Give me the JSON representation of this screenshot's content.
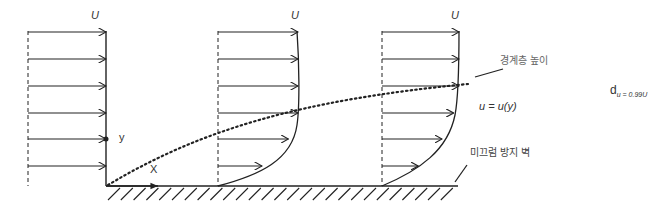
{
  "diagram": {
    "title": "",
    "labels": {
      "free_stream_1": "U",
      "free_stream_2": "U",
      "free_stream_3": "U",
      "y_axis": "y",
      "x_axis": "X",
      "boundary_layer_height": "경계층 높이",
      "velocity_profile": "u = u(y)",
      "no_slip_wall": "미끄럼 방지 벽",
      "delta_symbol": "d",
      "delta_subscript": "u = 0.99U"
    },
    "profiles": [
      {
        "name": "uniform-inlet",
        "velocity_fractions": [
          1,
          1,
          1,
          1,
          1,
          1
        ]
      },
      {
        "name": "developing-profile-1",
        "velocity_fractions": [
          1,
          1,
          1,
          1,
          0.88,
          0.55
        ]
      },
      {
        "name": "developing-profile-2",
        "velocity_fractions": [
          1,
          1,
          1,
          0.93,
          0.78,
          0.47
        ]
      }
    ],
    "colors": {
      "line": "#222222",
      "text": "#333333",
      "label_gray": "#555555"
    }
  }
}
